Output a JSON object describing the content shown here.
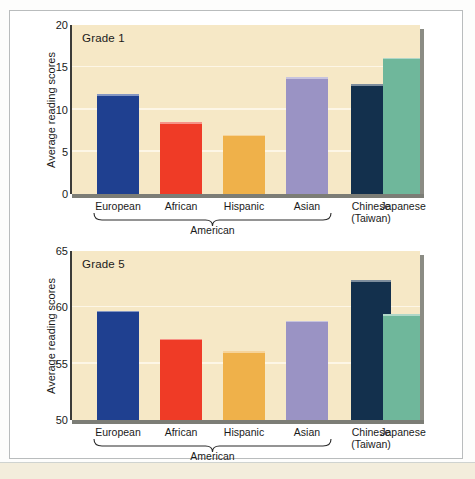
{
  "figure": {
    "background_color": "#ffffff",
    "plot_background_color": "#f6e8c6",
    "frame_color": "#b9bcbd"
  },
  "chart_data": [
    {
      "type": "bar",
      "title": "Grade 1",
      "xlabel": "",
      "ylabel": "Average reading scores",
      "ylim": [
        0,
        20
      ],
      "yticks": [
        0,
        5,
        10,
        15,
        20
      ],
      "grid": true,
      "legend": "none",
      "categories": [
        "European",
        "African",
        "Hispanic",
        "Asian",
        "Chinese\n(Taiwan)",
        "Japanese"
      ],
      "category_lines": [
        [
          "European"
        ],
        [
          "African"
        ],
        [
          "Hispanic"
        ],
        [
          "Asian"
        ],
        [
          "Chinese",
          "(Taiwan)"
        ],
        [
          "Japanese"
        ]
      ],
      "values": [
        11.8,
        8.5,
        7.0,
        13.8,
        13.0,
        16.1
      ],
      "colors": [
        "#1f4090",
        "#ef3b26",
        "#efb14a",
        "#9a93c4",
        "#13304d",
        "#6fb79b"
      ],
      "group_bracket_label": "American",
      "group_bracket_members": [
        "European",
        "African",
        "Hispanic",
        "Asian"
      ]
    },
    {
      "type": "bar",
      "title": "Grade 5",
      "xlabel": "",
      "ylabel": "Average reading scores",
      "ylim": [
        50,
        65
      ],
      "yticks": [
        50,
        55,
        60,
        65
      ],
      "grid": true,
      "legend": "none",
      "categories": [
        "European",
        "African",
        "Hispanic",
        "Asian",
        "Chinese\n(Taiwan)",
        "Japanese"
      ],
      "category_lines": [
        [
          "European"
        ],
        [
          "African"
        ],
        [
          "Hispanic"
        ],
        [
          "Asian"
        ],
        [
          "Chinese",
          "(Taiwan)"
        ],
        [
          "Japanese"
        ]
      ],
      "values": [
        59.7,
        57.2,
        56.1,
        58.8,
        62.4,
        59.4
      ],
      "colors": [
        "#1f4090",
        "#ef3b26",
        "#efb14a",
        "#9a93c4",
        "#13304d",
        "#6fb79b"
      ],
      "group_bracket_label": "American",
      "group_bracket_members": [
        "European",
        "African",
        "Hispanic",
        "Asian"
      ]
    }
  ]
}
